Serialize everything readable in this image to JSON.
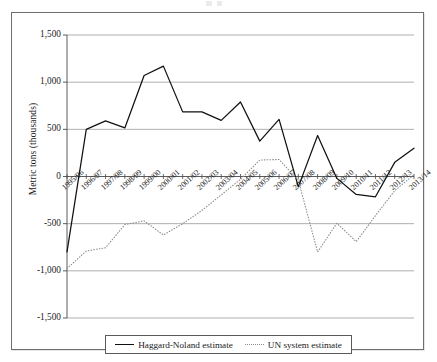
{
  "figure": {
    "frame_border_color": "#6e6e6e",
    "background": "#ffffff"
  },
  "chart_data": {
    "type": "line",
    "title": "",
    "xlabel": "",
    "ylabel": "Metric tons (thousands)",
    "categories": [
      "1995/96",
      "1996/97",
      "1997/98",
      "1998/99",
      "1999/00",
      "2000/01",
      "2001/02",
      "2002/03",
      "2003/04",
      "2004/05",
      "2005/06",
      "2006/07",
      "2007/08",
      "2008/09",
      "2009/10",
      "2010/11",
      "2011/12",
      "2012/13",
      "2013/14"
    ],
    "ylim": [
      -1500,
      1500
    ],
    "yticks": [
      1500,
      1000,
      500,
      0,
      -500,
      -1000,
      -1500
    ],
    "ytick_labels": [
      "1,500",
      "1,000",
      "500",
      "0",
      "-500",
      "-1,000",
      "-1,500"
    ],
    "grid": "horizontal",
    "legend_position": "bottom",
    "series": [
      {
        "name": "Haggard-Noland estimate",
        "style": "solid",
        "color": "#111111",
        "values": [
          -800,
          500,
          590,
          515,
          1070,
          1170,
          685,
          685,
          595,
          790,
          375,
          605,
          -110,
          435,
          -20,
          -190,
          -215,
          150,
          300
        ]
      },
      {
        "name": "UN system estimate",
        "style": "dotted",
        "color": "#8a8a8a",
        "values": [
          -975,
          -790,
          -755,
          -510,
          -470,
          -620,
          -500,
          -360,
          -195,
          -30,
          175,
          180,
          -40,
          -800,
          -495,
          -690,
          -415,
          -150,
          20
        ]
      }
    ]
  },
  "legend": {
    "items": [
      {
        "label": "Haggard-Noland estimate",
        "style": "solid"
      },
      {
        "label": "UN system estimate",
        "style": "dotted"
      }
    ]
  }
}
